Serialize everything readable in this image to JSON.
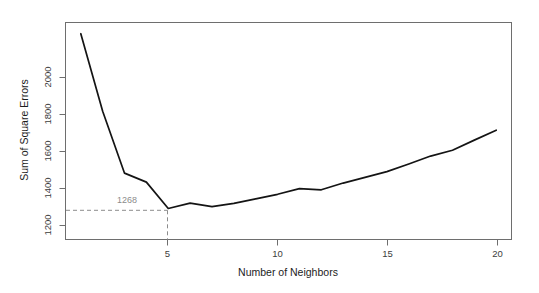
{
  "chart_data": {
    "type": "line",
    "title": "",
    "xlabel": "Number of Neighbors",
    "ylabel": "Sum of Square Errors",
    "x": [
      1,
      2,
      3,
      4,
      5,
      6,
      7,
      8,
      9,
      10,
      11,
      12,
      13,
      14,
      15,
      16,
      17,
      18,
      19,
      20
    ],
    "values": [
      2045,
      1700,
      1425,
      1385,
      1268,
      1292,
      1276,
      1291,
      1311,
      1331,
      1356,
      1351,
      1381,
      1406,
      1432,
      1466,
      1501,
      1527,
      1572,
      1616
    ],
    "series": [
      {
        "name": "Sum of Square Errors",
        "values": [
          2045,
          1700,
          1425,
          1385,
          1268,
          1292,
          1276,
          1291,
          1311,
          1331,
          1356,
          1351,
          1381,
          1406,
          1432,
          1466,
          1501,
          1527,
          1572,
          1616
        ]
      }
    ],
    "xlim": [
      0.3,
      20.7
    ],
    "ylim": [
      1130,
      2095
    ],
    "xticks": [
      5,
      10,
      15,
      20
    ],
    "xtick_labels": [
      "5",
      "10",
      "15",
      "20"
    ],
    "yticks": [
      1200,
      1400,
      1600,
      1800,
      2000
    ],
    "ytick_labels": [
      "1200",
      "1400",
      "1600",
      "1800",
      "2000"
    ],
    "grid": false,
    "legend": false,
    "legend_position": "none",
    "line_color": "#141414",
    "annotations": [
      {
        "label": "1268",
        "x": 5,
        "y": 1268,
        "kind": "minimum-marker",
        "guide_style": "dashed",
        "guide_color": "#8c8c8c"
      }
    ]
  },
  "axis": {
    "x_title": "Number of Neighbors",
    "y_title": "Sum of Square Errors",
    "x_tick_labels": [
      "5",
      "10",
      "15",
      "20"
    ],
    "y_tick_labels": [
      "1200",
      "1400",
      "1600",
      "1800",
      "2000"
    ]
  },
  "annotation": {
    "min_value_label": "1268"
  },
  "colors": {
    "line": "#141414",
    "frame": "#6e6e6e",
    "guide": "#8c8c8c",
    "background": "#ffffff",
    "tick_text": "#3c3c3c"
  }
}
